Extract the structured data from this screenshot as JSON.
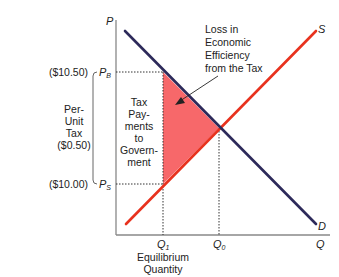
{
  "diagram": {
    "type": "supply-demand-tax",
    "axes": {
      "y_label": "P",
      "x_label": "Q"
    },
    "curves": {
      "supply_label": "S",
      "demand_label": "D",
      "supply_color": "#e8321e",
      "demand_color": "#2d2a5a"
    },
    "prices": {
      "buyer_price_label": "P",
      "buyer_price_sub": "B",
      "buyer_price_value": "($10.50)",
      "seller_price_label": "P",
      "seller_price_sub": "S",
      "seller_price_value": "($10.00)"
    },
    "quantities": {
      "q1_label": "Q",
      "q1_sub": "1",
      "q0_label": "Q",
      "q0_sub": "0",
      "q1_caption_line1": "Equilibrium",
      "q1_caption_line2": "Quantity"
    },
    "per_unit_tax": {
      "line1": "Per-",
      "line2": "Unit",
      "line3": "Tax",
      "line4": "($0.50)"
    },
    "tax_payments": {
      "line1": "Tax",
      "line2": "Pay-",
      "line3": "ments",
      "line4": "to",
      "line5": "Govern-",
      "line6": "ment"
    },
    "deadweight_loss": {
      "line1": "Loss in",
      "line2": "Economic",
      "line3": "Efficiency",
      "line4": "from the Tax",
      "fill_color": "#f6585a"
    }
  }
}
